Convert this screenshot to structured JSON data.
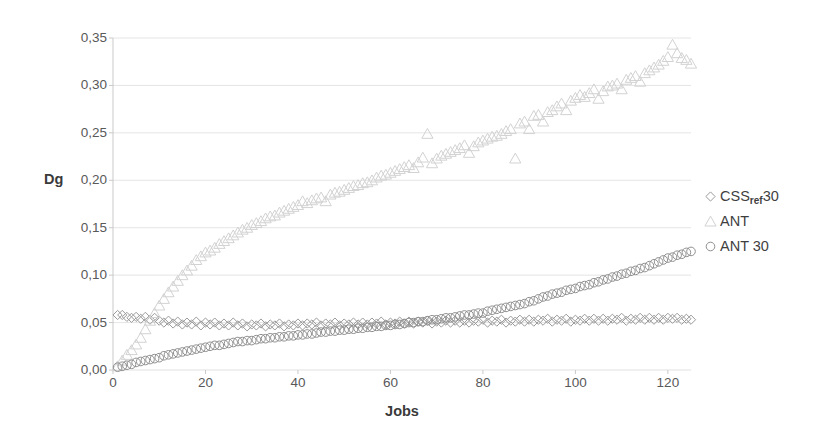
{
  "chart_data": {
    "type": "scatter",
    "title": "",
    "xlabel": "Jobs",
    "ylabel": "Dg",
    "xlim": [
      0,
      125
    ],
    "ylim": [
      0,
      0.35
    ],
    "grid": true,
    "legend_position": "right",
    "x_ticks": [
      "0",
      "20",
      "40",
      "60",
      "80",
      "100",
      "120"
    ],
    "x_tick_values": [
      0,
      20,
      40,
      60,
      80,
      100,
      120
    ],
    "y_ticks": [
      "0,00",
      "0,05",
      "0,10",
      "0,15",
      "0,20",
      "0,25",
      "0,30",
      "0,35"
    ],
    "y_tick_values": [
      0.0,
      0.05,
      0.1,
      0.15,
      0.2,
      0.25,
      0.3,
      0.35
    ],
    "series": [
      {
        "name": "CSS_ref 30",
        "legend_label": "CSS",
        "legend_sub": "ref",
        "legend_suffix": "30",
        "marker": "diamond",
        "color": "#9a9a9a",
        "x": [
          1,
          2,
          3,
          4,
          5,
          6,
          7,
          8,
          9,
          10,
          11,
          12,
          13,
          14,
          15,
          16,
          17,
          18,
          19,
          20,
          21,
          22,
          23,
          24,
          25,
          26,
          27,
          28,
          29,
          30,
          31,
          32,
          33,
          34,
          35,
          36,
          37,
          38,
          39,
          40,
          41,
          42,
          43,
          44,
          45,
          46,
          47,
          48,
          49,
          50,
          51,
          52,
          53,
          54,
          55,
          56,
          57,
          58,
          59,
          60,
          61,
          62,
          63,
          64,
          65,
          66,
          67,
          68,
          69,
          70,
          71,
          72,
          73,
          74,
          75,
          76,
          77,
          78,
          79,
          80,
          81,
          82,
          83,
          84,
          85,
          86,
          87,
          88,
          89,
          90,
          91,
          92,
          93,
          94,
          95,
          96,
          97,
          98,
          99,
          100,
          101,
          102,
          103,
          104,
          105,
          106,
          107,
          108,
          109,
          110,
          111,
          112,
          113,
          114,
          115,
          116,
          117,
          118,
          119,
          120,
          121,
          122,
          123,
          124,
          125
        ],
        "y": [
          0.058,
          0.058,
          0.056,
          0.055,
          0.056,
          0.054,
          0.056,
          0.053,
          0.055,
          0.052,
          0.05,
          0.052,
          0.049,
          0.051,
          0.048,
          0.05,
          0.048,
          0.051,
          0.047,
          0.05,
          0.048,
          0.05,
          0.047,
          0.049,
          0.047,
          0.05,
          0.047,
          0.049,
          0.046,
          0.048,
          0.047,
          0.049,
          0.046,
          0.048,
          0.047,
          0.049,
          0.046,
          0.048,
          0.047,
          0.049,
          0.047,
          0.049,
          0.048,
          0.05,
          0.047,
          0.049,
          0.048,
          0.05,
          0.047,
          0.049,
          0.048,
          0.05,
          0.048,
          0.05,
          0.048,
          0.05,
          0.049,
          0.051,
          0.048,
          0.05,
          0.049,
          0.051,
          0.049,
          0.051,
          0.049,
          0.051,
          0.05,
          0.052,
          0.049,
          0.051,
          0.05,
          0.052,
          0.05,
          0.052,
          0.05,
          0.052,
          0.05,
          0.052,
          0.051,
          0.053,
          0.05,
          0.052,
          0.051,
          0.053,
          0.05,
          0.052,
          0.051,
          0.053,
          0.051,
          0.053,
          0.051,
          0.053,
          0.052,
          0.054,
          0.051,
          0.053,
          0.052,
          0.054,
          0.051,
          0.053,
          0.052,
          0.054,
          0.052,
          0.054,
          0.052,
          0.054,
          0.052,
          0.054,
          0.053,
          0.055,
          0.052,
          0.054,
          0.053,
          0.055,
          0.053,
          0.055,
          0.053,
          0.055,
          0.053,
          0.055,
          0.054,
          0.055,
          0.053,
          0.054,
          0.053
        ]
      },
      {
        "name": "ANT",
        "legend_label": "ANT",
        "marker": "triangle",
        "color": "#d2d2d2",
        "x": [
          1,
          2,
          3,
          4,
          5,
          6,
          7,
          8,
          9,
          10,
          11,
          12,
          13,
          14,
          15,
          16,
          17,
          18,
          19,
          20,
          21,
          22,
          23,
          24,
          25,
          26,
          27,
          28,
          29,
          30,
          31,
          32,
          33,
          34,
          35,
          36,
          37,
          38,
          39,
          40,
          41,
          42,
          43,
          44,
          45,
          46,
          47,
          48,
          49,
          50,
          51,
          52,
          53,
          54,
          55,
          56,
          57,
          58,
          59,
          60,
          61,
          62,
          63,
          64,
          65,
          66,
          67,
          68,
          69,
          70,
          71,
          72,
          73,
          74,
          75,
          76,
          77,
          78,
          79,
          80,
          81,
          82,
          83,
          84,
          85,
          86,
          87,
          88,
          89,
          90,
          91,
          92,
          93,
          94,
          95,
          96,
          97,
          98,
          99,
          100,
          101,
          102,
          103,
          104,
          105,
          106,
          107,
          108,
          109,
          110,
          111,
          112,
          113,
          114,
          115,
          116,
          117,
          118,
          119,
          120,
          121,
          122,
          123,
          124,
          125
        ],
        "y": [
          0.004,
          0.01,
          0.016,
          0.021,
          0.027,
          0.034,
          0.043,
          0.052,
          0.06,
          0.068,
          0.075,
          0.082,
          0.088,
          0.094,
          0.1,
          0.105,
          0.11,
          0.116,
          0.12,
          0.124,
          0.126,
          0.129,
          0.133,
          0.136,
          0.139,
          0.142,
          0.145,
          0.148,
          0.15,
          0.153,
          0.155,
          0.157,
          0.16,
          0.162,
          0.163,
          0.166,
          0.168,
          0.17,
          0.172,
          0.174,
          0.178,
          0.176,
          0.179,
          0.181,
          0.182,
          0.178,
          0.185,
          0.187,
          0.188,
          0.19,
          0.192,
          0.194,
          0.195,
          0.197,
          0.198,
          0.2,
          0.203,
          0.205,
          0.206,
          0.208,
          0.21,
          0.212,
          0.214,
          0.216,
          0.213,
          0.219,
          0.224,
          0.249,
          0.218,
          0.223,
          0.226,
          0.228,
          0.23,
          0.232,
          0.234,
          0.237,
          0.229,
          0.236,
          0.24,
          0.242,
          0.244,
          0.246,
          0.247,
          0.249,
          0.252,
          0.254,
          0.223,
          0.26,
          0.262,
          0.254,
          0.268,
          0.269,
          0.262,
          0.272,
          0.274,
          0.278,
          0.281,
          0.274,
          0.284,
          0.287,
          0.29,
          0.288,
          0.292,
          0.296,
          0.286,
          0.294,
          0.299,
          0.3,
          0.302,
          0.296,
          0.306,
          0.308,
          0.31,
          0.304,
          0.313,
          0.316,
          0.319,
          0.322,
          0.326,
          0.33,
          0.343,
          0.334,
          0.329,
          0.327,
          0.323
        ]
      },
      {
        "name": "ANT 30",
        "legend_label": "ANT 30",
        "marker": "circle",
        "color": "#8f8f8f",
        "x": [
          1,
          2,
          3,
          4,
          5,
          6,
          7,
          8,
          9,
          10,
          11,
          12,
          13,
          14,
          15,
          16,
          17,
          18,
          19,
          20,
          21,
          22,
          23,
          24,
          25,
          26,
          27,
          28,
          29,
          30,
          31,
          32,
          33,
          34,
          35,
          36,
          37,
          38,
          39,
          40,
          41,
          42,
          43,
          44,
          45,
          46,
          47,
          48,
          49,
          50,
          51,
          52,
          53,
          54,
          55,
          56,
          57,
          58,
          59,
          60,
          61,
          62,
          63,
          64,
          65,
          66,
          67,
          68,
          69,
          70,
          71,
          72,
          73,
          74,
          75,
          76,
          77,
          78,
          79,
          80,
          81,
          82,
          83,
          84,
          85,
          86,
          87,
          88,
          89,
          90,
          91,
          92,
          93,
          94,
          95,
          96,
          97,
          98,
          99,
          100,
          101,
          102,
          103,
          104,
          105,
          106,
          107,
          108,
          109,
          110,
          111,
          112,
          113,
          114,
          115,
          116,
          117,
          118,
          119,
          120,
          121,
          122,
          123,
          124,
          125
        ],
        "y": [
          0.003,
          0.004,
          0.005,
          0.006,
          0.008,
          0.009,
          0.01,
          0.011,
          0.012,
          0.013,
          0.015,
          0.016,
          0.017,
          0.018,
          0.019,
          0.02,
          0.021,
          0.022,
          0.023,
          0.024,
          0.025,
          0.026,
          0.026,
          0.027,
          0.028,
          0.029,
          0.03,
          0.03,
          0.031,
          0.031,
          0.032,
          0.033,
          0.033,
          0.034,
          0.034,
          0.035,
          0.035,
          0.036,
          0.036,
          0.037,
          0.037,
          0.038,
          0.038,
          0.039,
          0.04,
          0.04,
          0.041,
          0.041,
          0.042,
          0.042,
          0.043,
          0.043,
          0.044,
          0.044,
          0.045,
          0.045,
          0.046,
          0.046,
          0.047,
          0.047,
          0.048,
          0.048,
          0.049,
          0.05,
          0.05,
          0.051,
          0.051,
          0.052,
          0.053,
          0.053,
          0.054,
          0.055,
          0.055,
          0.056,
          0.057,
          0.058,
          0.058,
          0.059,
          0.06,
          0.06,
          0.062,
          0.063,
          0.064,
          0.065,
          0.066,
          0.067,
          0.068,
          0.069,
          0.07,
          0.072,
          0.073,
          0.075,
          0.077,
          0.078,
          0.08,
          0.081,
          0.082,
          0.084,
          0.085,
          0.086,
          0.088,
          0.089,
          0.09,
          0.092,
          0.093,
          0.095,
          0.096,
          0.098,
          0.099,
          0.101,
          0.102,
          0.104,
          0.105,
          0.107,
          0.108,
          0.11,
          0.112,
          0.114,
          0.116,
          0.118,
          0.119,
          0.121,
          0.122,
          0.124,
          0.125
        ]
      }
    ]
  },
  "axis": {
    "y_title": "Dg",
    "x_title": "Jobs"
  }
}
